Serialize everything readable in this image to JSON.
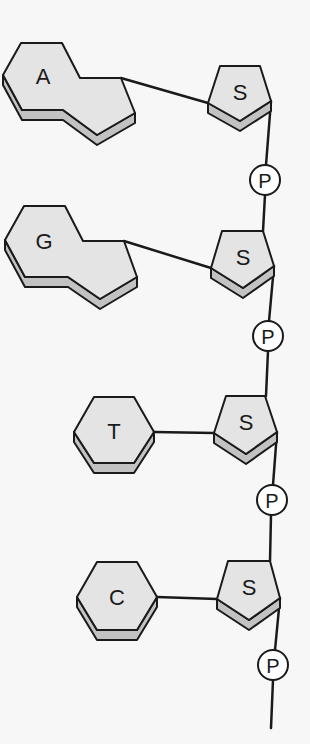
{
  "diagram": {
    "colors": {
      "face": "#e4e4e4",
      "side": "#c2c2c2",
      "stroke": "#1a1a1a",
      "phosphate_fill": "#ffffff",
      "background": "#f7f7f7"
    },
    "nucleotides": [
      {
        "base": {
          "label": "A",
          "shape": "double-ring"
        },
        "sugar": {
          "label": "S"
        },
        "phosphate": {
          "label": "P"
        }
      },
      {
        "base": {
          "label": "G",
          "shape": "double-ring"
        },
        "sugar": {
          "label": "S"
        },
        "phosphate": {
          "label": "P"
        }
      },
      {
        "base": {
          "label": "T",
          "shape": "single-ring"
        },
        "sugar": {
          "label": "S"
        },
        "phosphate": {
          "label": "P"
        }
      },
      {
        "base": {
          "label": "C",
          "shape": "single-ring"
        },
        "sugar": {
          "label": "S"
        },
        "phosphate": {
          "label": "P"
        }
      }
    ]
  }
}
